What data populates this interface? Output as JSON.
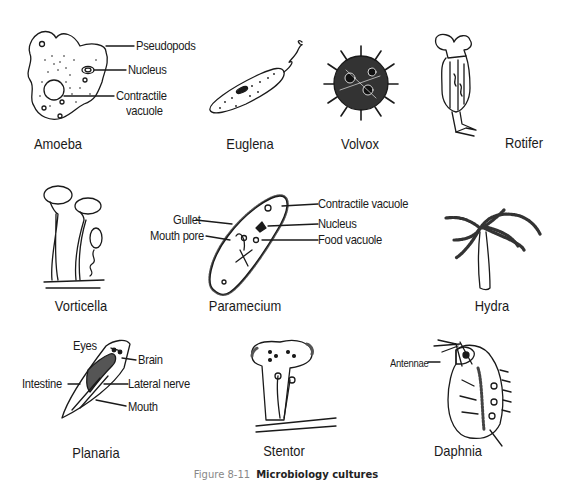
{
  "organisms": [
    {
      "name": "Amoeba",
      "labels": [
        "Pseudopods",
        "Nucleus",
        "Contractile",
        "vacuole"
      ]
    },
    {
      "name": "Euglena",
      "labels": []
    },
    {
      "name": "Volvox",
      "labels": []
    },
    {
      "name": "Rotifer",
      "labels": []
    },
    {
      "name": "Vorticella",
      "labels": []
    },
    {
      "name": "Paramecium",
      "labels": [
        "Gullet",
        "Mouth pore",
        "Contractile vacuole",
        "Nucleus",
        "Food vacuole"
      ]
    },
    {
      "name": "Hydra",
      "labels": []
    },
    {
      "name": "Planaria",
      "labels": [
        "Eyes",
        "Brain",
        "Intestine",
        "Lateral nerve",
        "Mouth"
      ]
    },
    {
      "name": "Stentor",
      "labels": []
    },
    {
      "name": "Daphnia",
      "labels": [
        "Antennae"
      ]
    }
  ],
  "caption": {
    "number": "Figure 8-11",
    "title": "Microbiology cultures"
  },
  "colors": {
    "ink": "#1a1a1a",
    "caption_number": "#888888",
    "background": "#ffffff"
  }
}
